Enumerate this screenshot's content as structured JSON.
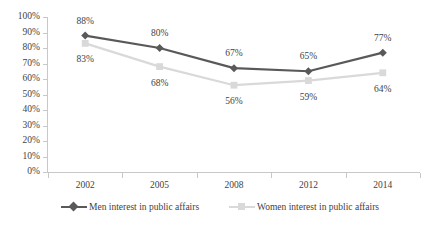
{
  "chart_data": {
    "type": "line",
    "title": "",
    "subtitle": "",
    "xlabel": "",
    "ylabel": "",
    "categories": [
      "2002",
      "2005",
      "2008",
      "2012",
      "2014"
    ],
    "ylim": [
      0,
      100
    ],
    "y_ticks": [
      "0%",
      "10%",
      "20%",
      "30%",
      "40%",
      "50%",
      "60%",
      "70%",
      "80%",
      "90%",
      "100%"
    ],
    "y_tick_values": [
      0,
      10,
      20,
      30,
      40,
      50,
      60,
      70,
      80,
      90,
      100
    ],
    "grid": false,
    "legend_position": "bottom",
    "series": [
      {
        "name": "Men interest  in public affairs",
        "color": "#595959",
        "marker": "diamond",
        "values": [
          88,
          80,
          67,
          65,
          77
        ],
        "labels": [
          "88%",
          "80%",
          "67%",
          "65%",
          "77%"
        ],
        "label_side": "above"
      },
      {
        "name": "Women interest  in public affairs",
        "color": "#d9d9d9",
        "marker": "square",
        "values": [
          83,
          68,
          56,
          59,
          64
        ],
        "labels": [
          "83%",
          "68%",
          "56%",
          "59%",
          "64%"
        ],
        "label_side": "below"
      }
    ]
  },
  "colors": {
    "men_series": "#595959",
    "women_series": "#d9d9d9",
    "axis": "#c8c8c8",
    "text": "#3f3f3f",
    "background": "#ffffff"
  }
}
